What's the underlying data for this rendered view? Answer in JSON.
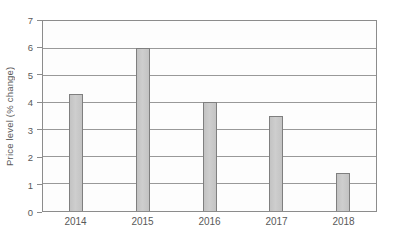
{
  "chart_data": {
    "type": "bar",
    "title": "",
    "xlabel": "",
    "ylabel": "Price level (% change)",
    "categories": [
      "2014",
      "2015",
      "2016",
      "2017",
      "2018"
    ],
    "values": [
      4.3,
      6,
      4,
      3.5,
      1.4
    ],
    "ylim": [
      0,
      7
    ],
    "ytick_step": 1,
    "ytick_labels": [
      "0",
      "1",
      "2",
      "3",
      "4",
      "5",
      "6",
      "7"
    ],
    "grid": "horizontal",
    "legend": "none",
    "colors": {
      "bar_fill": "#c9c9c9",
      "bar_border": "#7f7f7f",
      "grid": "#999999",
      "axis": "#8c8c8c",
      "text": "#595959",
      "background": "#ffffff"
    }
  }
}
